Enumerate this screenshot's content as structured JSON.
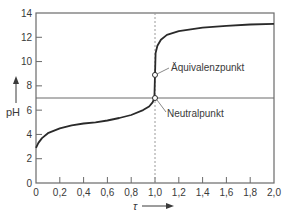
{
  "chart_data": {
    "type": "line",
    "title": "",
    "xlabel": "τ",
    "ylabel": "pH",
    "xlim": [
      0,
      2.0
    ],
    "ylim": [
      0,
      14
    ],
    "grid": false,
    "legend": null,
    "x_ticks": [
      "0",
      "0,2",
      "0,4",
      "0,6",
      "0,8",
      "1,0",
      "1,2",
      "1,4",
      "1,6",
      "1,8",
      "2,0"
    ],
    "y_ticks": [
      "0",
      "2",
      "4",
      "6",
      "8",
      "10",
      "12",
      "14"
    ],
    "series": [
      {
        "name": "Titrationskurve",
        "x": [
          0,
          0.02,
          0.05,
          0.1,
          0.2,
          0.3,
          0.4,
          0.5,
          0.6,
          0.7,
          0.8,
          0.9,
          0.95,
          0.98,
          0.995,
          1.0,
          1.005,
          1.02,
          1.05,
          1.1,
          1.2,
          1.4,
          1.6,
          1.8,
          2.0
        ],
        "values": [
          2.9,
          3.3,
          3.7,
          4.1,
          4.5,
          4.75,
          4.9,
          5.0,
          5.15,
          5.35,
          5.6,
          6.0,
          6.3,
          6.65,
          7.0,
          8.9,
          10.7,
          11.3,
          11.8,
          12.2,
          12.5,
          12.8,
          12.95,
          13.05,
          13.1
        ]
      }
    ],
    "reference_lines": [
      {
        "orientation": "horizontal",
        "value": 7,
        "style": "solid"
      },
      {
        "orientation": "vertical",
        "value": 1.0,
        "style": "dashed"
      }
    ],
    "annotations": [
      {
        "text": "Äquivalenzpunkt",
        "x": 1.0,
        "y": 8.9
      },
      {
        "text": "Neutralpunkt",
        "x": 1.0,
        "y": 7.0
      }
    ]
  },
  "labels": {
    "x_axis": "τ",
    "y_axis": "pH",
    "equivalence_point": "Äquivalenzpunkt",
    "neutral_point": "Neutralpunkt"
  },
  "colors": {
    "curve": "#2a2a2a",
    "frame": "#6a6a6a",
    "reference": "#6a6a6a",
    "text": "#3a3a3a"
  }
}
